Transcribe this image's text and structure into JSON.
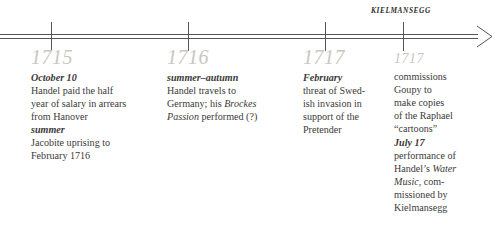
{
  "axis": {
    "era_label": "KIELMANSEGG",
    "arrow_direction": "right",
    "tick_positions": [
      51,
      188,
      325,
      403
    ],
    "line_color": "#555555",
    "tick_color": "#555555"
  },
  "year_label_color": "#c9c6c1",
  "body_text_color": "#3b3a38",
  "entries": [
    {
      "year": "1715",
      "events": [
        {
          "date": "October 10",
          "lines": [
            "Handel paid the half",
            "year of salary in arrears",
            "from Hanover"
          ]
        },
        {
          "date": "summer",
          "lines": [
            "Jacobite uprising to",
            "February 1716"
          ]
        }
      ]
    },
    {
      "year": "1716",
      "events": [
        {
          "date": "summer–autumn",
          "lines": [
            "Handel travels to",
            "Germany; his Brockes",
            "Passion performed (?)"
          ],
          "italic_phrases": [
            "Brockes",
            "Passion"
          ]
        }
      ]
    },
    {
      "year": "1717",
      "events": [
        {
          "date": "February",
          "lines": [
            "threat of Swed-",
            "ish invasion in",
            "support of the",
            "Pretender"
          ]
        }
      ]
    },
    {
      "year": "1717",
      "small_year": true,
      "events": [
        {
          "date": "",
          "lines": [
            "commissions",
            "Goupy to",
            "make copies",
            "of the Raphael",
            "“cartoons”"
          ]
        },
        {
          "date": "July 17",
          "lines": [
            "performance of",
            "Handel’s Water",
            "Music, com-",
            "missioned by",
            "Kielmansegg"
          ],
          "italic_phrases": [
            "Water",
            "Music"
          ]
        }
      ]
    }
  ]
}
